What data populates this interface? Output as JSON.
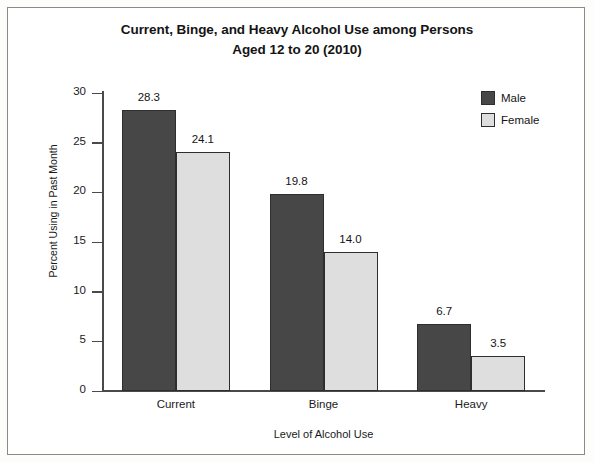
{
  "chart_data": {
    "type": "bar",
    "title": "Current, Binge, and Heavy Alcohol Use among Persons Aged 12 to 20 (2010)",
    "title_line1": "Current, Binge, and Heavy Alcohol Use among Persons",
    "title_line2": "Aged 12 to 20 (2010)",
    "xlabel": "Level of Alcohol Use",
    "ylabel": "Percent Using in Past Month",
    "categories": [
      "Current",
      "Binge",
      "Heavy"
    ],
    "series": [
      {
        "name": "Male",
        "values": [
          28.3,
          19.8,
          6.7
        ],
        "color": "#474747"
      },
      {
        "name": "Female",
        "values": [
          24.1,
          14.0,
          3.5
        ],
        "color": "#dedede"
      }
    ],
    "value_labels": [
      [
        "28.3",
        "24.1"
      ],
      [
        "19.8",
        "14.0"
      ],
      [
        "6.7",
        "3.5"
      ]
    ],
    "ylim": [
      0,
      30
    ],
    "yticks": [
      0,
      5,
      10,
      15,
      20,
      25,
      30
    ],
    "ytick_labels": [
      "0",
      "5",
      "10",
      "15",
      "20",
      "25",
      "30"
    ],
    "grid": false,
    "legend_position": "top-right"
  }
}
